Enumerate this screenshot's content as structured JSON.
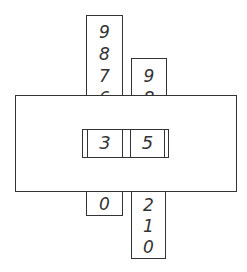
{
  "diagram": {
    "left_strip": {
      "digits_above": [
        "9",
        "8",
        "7",
        "6"
      ],
      "digits_below": [
        "0"
      ]
    },
    "right_strip": {
      "digits_above": [
        "9",
        "8"
      ],
      "digits_below": [
        "2",
        "1",
        "0"
      ]
    },
    "window": {
      "tens_digit": "3",
      "ones_digit": "5"
    },
    "colors": {
      "line": "#333333",
      "background": "#ffffff"
    }
  }
}
